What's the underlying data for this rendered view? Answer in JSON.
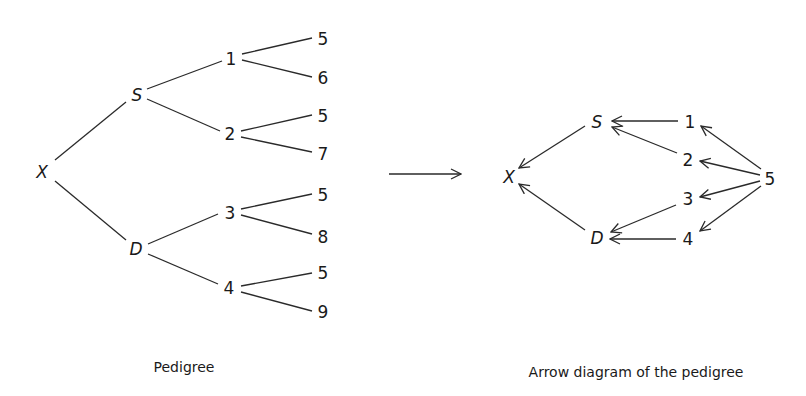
{
  "pedigree": {
    "caption": "Pedigree",
    "root": "X",
    "parents": {
      "sire": "S",
      "dam": "D"
    },
    "grandparents": [
      "1",
      "2",
      "3",
      "4"
    ],
    "great_grandparents": [
      "5",
      "6",
      "5",
      "7",
      "5",
      "8",
      "5",
      "9"
    ]
  },
  "transform_arrow": "→",
  "arrow_diagram": {
    "caption": "Arrow diagram of the pedigree",
    "nodes": {
      "x": "X",
      "s": "S",
      "d": "D",
      "n1": "1",
      "n2": "2",
      "n3": "3",
      "n4": "4",
      "n5": "5"
    },
    "edges": [
      [
        "S",
        "X"
      ],
      [
        "D",
        "X"
      ],
      [
        "1",
        "S"
      ],
      [
        "2",
        "S"
      ],
      [
        "3",
        "D"
      ],
      [
        "4",
        "D"
      ],
      [
        "5",
        "1"
      ],
      [
        "5",
        "2"
      ],
      [
        "5",
        "3"
      ],
      [
        "5",
        "4"
      ]
    ]
  }
}
